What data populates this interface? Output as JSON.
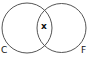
{
  "diagram": {
    "type": "venn",
    "sets": [
      {
        "name": "C",
        "label": "C"
      },
      {
        "name": "F",
        "label": "F"
      }
    ],
    "intersection_label": "x",
    "stroke_color": "#555555"
  }
}
